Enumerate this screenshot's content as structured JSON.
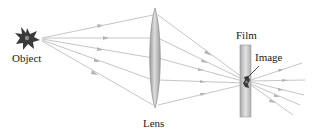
{
  "diagram": {
    "type": "optics-ray-diagram",
    "labels": {
      "object": "Object",
      "lens": "Lens",
      "film": "Film",
      "image": "Image"
    },
    "colors": {
      "ray": "#c4c4c4",
      "arrow": "#b0b0b0",
      "lens_fill": "#b8b8b8",
      "lens_edge": "#8a8a8a",
      "film_fill": "#bdbdbd",
      "object": "#3a3a3a",
      "text": "#1a1a1a"
    },
    "elements": {
      "object": {
        "x": 27,
        "y": 38
      },
      "lens": {
        "cx": 155,
        "top": 8,
        "bottom": 108
      },
      "film": {
        "x": 240,
        "y": 45,
        "width": 11,
        "height": 72
      },
      "image_point": {
        "x": 246,
        "y": 82
      }
    },
    "ray_count": 5
  }
}
